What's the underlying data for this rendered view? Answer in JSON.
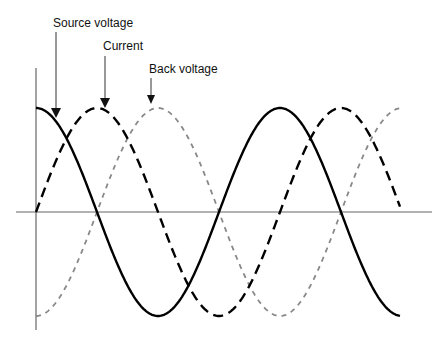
{
  "diagram": {
    "title": "",
    "labels": {
      "source_voltage": "Source voltage",
      "current": "Current",
      "back_voltage": "Back voltage"
    },
    "colors": {
      "source_voltage": "#000000",
      "current": "#000000",
      "back_voltage": "#888888",
      "axes": "#666666",
      "text": "#111111"
    },
    "axes": {
      "origin_x": 36,
      "zero_y": 212,
      "x_end": 432,
      "y_top": 68,
      "y_bottom": 330
    },
    "waves": {
      "amplitude_px": 104,
      "period_px": 244,
      "x_start": 36,
      "x_end": 400,
      "series": [
        {
          "name": "Source voltage",
          "style": "solid",
          "phase": "cosine (peak at origin)"
        },
        {
          "name": "Current",
          "style": "dashed",
          "phase": "sine (zero rising at origin, lags source by 90°)"
        },
        {
          "name": "Back voltage",
          "style": "dashed-gray",
          "phase": "negative cosine (trough at origin, opposite source)"
        }
      ]
    }
  }
}
